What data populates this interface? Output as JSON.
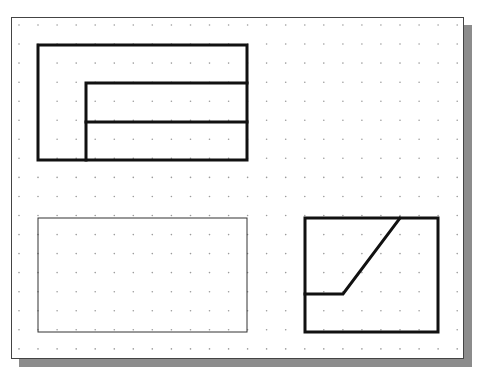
{
  "canvas": {
    "frame": {
      "x": 11,
      "y": 17,
      "width": 453,
      "height": 342
    },
    "shadow": {
      "offset": 8,
      "color": "#8c8c8c"
    },
    "background": "#ffffff",
    "border_color": "#444444"
  },
  "grid": {
    "origin_x": 19,
    "origin_y": 25,
    "spacing": 19.05,
    "cols": 24,
    "rows": 18,
    "dot_color": "#9a9a9a",
    "dot_radius": 0.8
  },
  "colors": {
    "thick_line": "#111111",
    "thin_line": "#333333"
  },
  "shapes": [
    {
      "name": "front-view-outer-rect",
      "type": "rect",
      "x": 38,
      "y": 45,
      "width": 209,
      "height": 115,
      "stroke_width": 3
    },
    {
      "name": "front-view-inner-rect",
      "type": "polyline",
      "points": [
        [
          86,
          160
        ],
        [
          86,
          83
        ],
        [
          247,
          83
        ]
      ],
      "stroke_width": 3
    },
    {
      "name": "front-view-middle-line",
      "type": "line",
      "x1": 86,
      "y1": 122,
      "x2": 247,
      "y2": 122,
      "stroke_width": 3
    },
    {
      "name": "top-view-thin-rect",
      "type": "rect",
      "x": 38,
      "y": 218,
      "width": 209,
      "height": 114,
      "stroke_width": 1
    },
    {
      "name": "side-view-rect",
      "type": "rect",
      "x": 305,
      "y": 218,
      "width": 133,
      "height": 114,
      "stroke_width": 3
    },
    {
      "name": "side-view-slanted-edge",
      "type": "polyline",
      "points": [
        [
          305,
          294
        ],
        [
          343,
          294
        ],
        [
          400,
          218
        ]
      ],
      "stroke_width": 3
    }
  ]
}
